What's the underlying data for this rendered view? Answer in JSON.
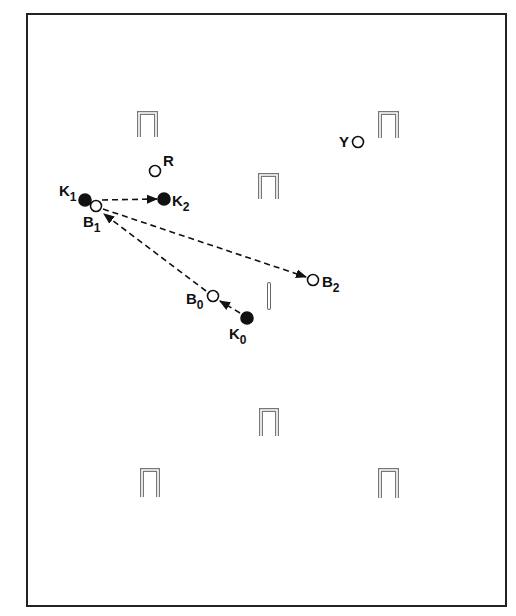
{
  "diagram": {
    "type": "croquet-court-shot-diagram",
    "court": {
      "x": 27,
      "y": 14,
      "width": 479,
      "height": 592,
      "stroke": "#222222"
    },
    "wickets": [
      {
        "id": "wicket-top-left",
        "x": 139,
        "y": 113,
        "w": 17,
        "h": 24
      },
      {
        "id": "wicket-top-right",
        "x": 380,
        "y": 113,
        "w": 17,
        "h": 25
      },
      {
        "id": "wicket-center-upper",
        "x": 260,
        "y": 175,
        "w": 17,
        "h": 24
      },
      {
        "id": "wicket-center-lower",
        "x": 261,
        "y": 410,
        "w": 16,
        "h": 26
      },
      {
        "id": "wicket-bottom-left",
        "x": 142,
        "y": 470,
        "w": 16,
        "h": 27
      },
      {
        "id": "wicket-bottom-right",
        "x": 380,
        "y": 470,
        "w": 17,
        "h": 28
      }
    ],
    "stake": {
      "x": 269,
      "y1": 284,
      "y2": 308
    },
    "balls": [
      {
        "id": "K1",
        "label": "K",
        "sub": "1",
        "cx": 85,
        "cy": 200,
        "filled": true,
        "lx": 59,
        "ly": 196
      },
      {
        "id": "B1",
        "label": "B",
        "sub": "1",
        "cx": 96,
        "cy": 206,
        "filled": false,
        "lx": 83,
        "ly": 227
      },
      {
        "id": "K2",
        "label": "K",
        "sub": "2",
        "cx": 164,
        "cy": 199,
        "filled": true,
        "lx": 172,
        "ly": 206
      },
      {
        "id": "R",
        "label": "R",
        "sub": "",
        "cx": 155,
        "cy": 171,
        "filled": false,
        "lx": 163,
        "ly": 166
      },
      {
        "id": "Y",
        "label": "Y",
        "sub": "",
        "cx": 358,
        "cy": 142,
        "filled": false,
        "lx": 339,
        "ly": 147
      },
      {
        "id": "B2",
        "label": "B",
        "sub": "2",
        "cx": 313,
        "cy": 280,
        "filled": false,
        "lx": 322,
        "ly": 287
      },
      {
        "id": "B0",
        "label": "B",
        "sub": "0",
        "cx": 213,
        "cy": 296,
        "filled": false,
        "lx": 186,
        "ly": 304
      },
      {
        "id": "K0",
        "label": "K",
        "sub": "0",
        "cx": 247,
        "cy": 318,
        "filled": true,
        "lx": 229,
        "ly": 339
      }
    ],
    "arrows": [
      {
        "id": "K1-to-K2",
        "x1": 102,
        "y1": 200,
        "x2": 157,
        "y2": 199
      },
      {
        "id": "B1-to-B2",
        "x1": 103,
        "y1": 209,
        "x2": 306,
        "y2": 277
      },
      {
        "id": "B0-to-B1",
        "x1": 206,
        "y1": 291,
        "x2": 104,
        "y2": 214
      },
      {
        "id": "K0-to-B0",
        "x1": 240,
        "y1": 313,
        "x2": 220,
        "y2": 301
      }
    ]
  }
}
